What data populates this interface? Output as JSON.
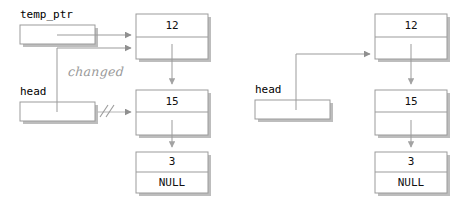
{
  "figure": {
    "colors": {
      "box_border": "#9b9b9b",
      "box_fill": "#ffffff",
      "box_shadow": "#b8b8b8",
      "line": "#9b9b9b",
      "arrow": "#8f8f8f",
      "text": "#000000",
      "annotation": "#9a9a9a",
      "background": "#ffffff"
    }
  },
  "left_diagram": {
    "name": "before-state",
    "pointers": [
      {
        "id": "temp_ptr",
        "label": "temp_ptr",
        "target": "node-12"
      },
      {
        "id": "head",
        "label": "head",
        "target": "node-12",
        "broken_target": "node-15"
      }
    ],
    "annotation": {
      "text": "changed",
      "break_marker": "//"
    },
    "nodes": [
      {
        "id": "node-12",
        "value": "12",
        "next": "node-15"
      },
      {
        "id": "node-15",
        "value": "15",
        "next": "node-3"
      },
      {
        "id": "node-3",
        "value": "3",
        "next": "NULL"
      }
    ]
  },
  "right_diagram": {
    "name": "after-state",
    "pointers": [
      {
        "id": "head",
        "label": "head",
        "target": "node-12"
      }
    ],
    "nodes": [
      {
        "id": "node-12",
        "value": "12",
        "next": "node-15"
      },
      {
        "id": "node-15",
        "value": "15",
        "next": "node-3"
      },
      {
        "id": "node-3",
        "value": "3",
        "next": "NULL"
      }
    ]
  }
}
